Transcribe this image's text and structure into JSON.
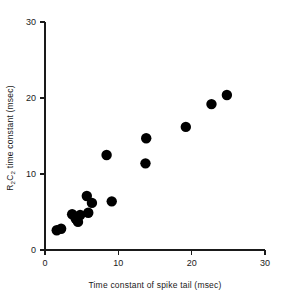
{
  "figure": {
    "background_color": "#ffffff",
    "point_color": "#000000",
    "axis_color": "#1a1a1a"
  },
  "chart_data": {
    "type": "scatter",
    "title": "",
    "xlabel": "Time constant of spike tail (msec)",
    "ylabel": "R2C2 time constant (msec)",
    "ylabel_parts": {
      "r": "R",
      "r_sub": "2",
      "c": "C",
      "c_sub": "2",
      "rest": " time constant (msec)"
    },
    "xlim": [
      0,
      30
    ],
    "ylim": [
      0,
      30
    ],
    "xticks": [
      0,
      10,
      20,
      30
    ],
    "yticks": [
      0,
      10,
      20,
      30
    ],
    "xtick_labels": [
      "0",
      "10",
      "20",
      "30"
    ],
    "ytick_labels": [
      "0",
      "10",
      "20",
      "30"
    ],
    "grid": false,
    "legend": false,
    "marker": "filled-circle",
    "marker_size": 5.2,
    "n_points": 16,
    "x": [
      1.6,
      2.2,
      3.7,
      4.2,
      4.5,
      4.8,
      5.9,
      5.7,
      6.4,
      8.4,
      9.1,
      13.7,
      13.8,
      19.2,
      22.7,
      24.8
    ],
    "y": [
      2.6,
      2.8,
      4.7,
      4.1,
      3.7,
      4.6,
      4.9,
      7.1,
      6.2,
      12.5,
      6.4,
      11.4,
      14.7,
      16.2,
      19.2,
      20.4
    ],
    "points": [
      {
        "x": 1.6,
        "y": 2.6
      },
      {
        "x": 2.2,
        "y": 2.8
      },
      {
        "x": 3.7,
        "y": 4.7
      },
      {
        "x": 4.2,
        "y": 4.1
      },
      {
        "x": 4.5,
        "y": 3.7
      },
      {
        "x": 4.8,
        "y": 4.6
      },
      {
        "x": 5.9,
        "y": 4.9
      },
      {
        "x": 5.7,
        "y": 7.1
      },
      {
        "x": 6.4,
        "y": 6.2
      },
      {
        "x": 8.4,
        "y": 12.5
      },
      {
        "x": 9.1,
        "y": 6.4
      },
      {
        "x": 13.7,
        "y": 11.4
      },
      {
        "x": 13.8,
        "y": 14.7
      },
      {
        "x": 19.2,
        "y": 16.2
      },
      {
        "x": 22.7,
        "y": 19.2
      },
      {
        "x": 24.8,
        "y": 20.4
      }
    ]
  }
}
